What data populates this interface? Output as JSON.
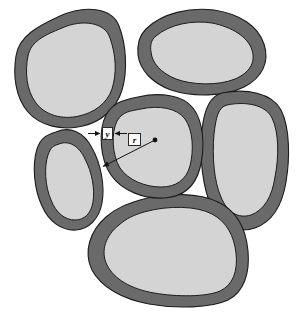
{
  "figure": {
    "background_color": "#ffffff",
    "shell_color": "#6a6a6a",
    "core_color": "#d4d4d4",
    "outline_color": "#1c1c1c",
    "annotation_color": "#141414"
  },
  "annotations": {
    "thickness_label": "y",
    "radius_label": "r",
    "thickness_description": "shell thickness measured across the dark rim",
    "radius_description": "radius from grain centre to outer rim"
  },
  "grains": [
    {
      "name": "grain-top-left",
      "core_fill": "#d4d4d4",
      "shell_fill": "#6a6a6a"
    },
    {
      "name": "grain-top-right",
      "core_fill": "#d4d4d4",
      "shell_fill": "#6a6a6a"
    },
    {
      "name": "grain-right",
      "core_fill": "#d4d4d4",
      "shell_fill": "#6a6a6a"
    },
    {
      "name": "grain-centre",
      "core_fill": "#d4d4d4",
      "shell_fill": "#6a6a6a"
    },
    {
      "name": "grain-left",
      "core_fill": "#d4d4d4",
      "shell_fill": "#6a6a6a"
    },
    {
      "name": "grain-bottom",
      "core_fill": "#d4d4d4",
      "shell_fill": "#6a6a6a"
    }
  ],
  "markers": {
    "centre_dot": {
      "x": 155,
      "y": 140,
      "r": 2.4
    },
    "radius_line": {
      "x1": 155,
      "y1": 140,
      "x2": 102,
      "y2": 167
    },
    "thickness_arrow_left": {
      "x1": 88,
      "y1": 133,
      "x2": 101,
      "y2": 133
    },
    "thickness_arrow_right": {
      "x1": 127,
      "y1": 133,
      "x2": 114,
      "y2": 133
    }
  }
}
